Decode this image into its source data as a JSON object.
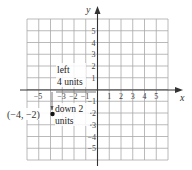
{
  "diagram": {
    "type": "coordinate-plane",
    "x_axis_label": "x",
    "y_axis_label": "y",
    "x_range": [
      -6,
      6
    ],
    "y_range": [
      -6,
      6
    ],
    "x_tick_labels": [
      "−5",
      "−3",
      "−2",
      "−1",
      "1",
      "2",
      "3",
      "4",
      "5"
    ],
    "y_tick_labels": [
      "5",
      "4",
      "3",
      "2",
      "1",
      "−1",
      "−2",
      "−3",
      "−4",
      "−5"
    ],
    "point": {
      "x": -4,
      "y": -2,
      "label": "(−4, −2)"
    },
    "annotations": {
      "left_line1": "left",
      "left_line2": "4 units",
      "down_line1": "down 2",
      "down_line2": "units"
    },
    "colors": {
      "grid": "#a8a8a8",
      "axis": "#333333",
      "point": "#111111"
    }
  }
}
